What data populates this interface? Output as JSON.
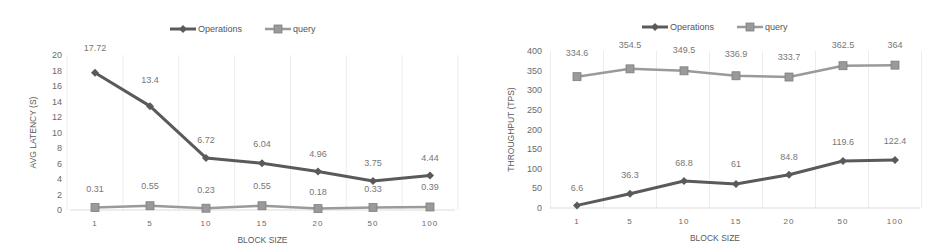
{
  "chart_data": [
    {
      "type": "line",
      "title": "",
      "xlabel": "BLOCK SIZE",
      "ylabel": "AVG LATENCY (S)",
      "categories": [
        "1",
        "5",
        "10",
        "15",
        "20",
        "50",
        "100"
      ],
      "ylim": [
        0,
        20
      ],
      "yticks": [
        0,
        2,
        4,
        6,
        8,
        10,
        12,
        14,
        16,
        18,
        20
      ],
      "grid": "vertical",
      "legend_position": "top",
      "series": [
        {
          "name": "Operations",
          "marker": "diamond",
          "color": "#5a5a5a",
          "values": [
            17.72,
            13.4,
            6.72,
            6.04,
            4.96,
            3.75,
            4.44
          ]
        },
        {
          "name": "query",
          "marker": "square",
          "color": "#9a9a9a",
          "values": [
            0.31,
            0.55,
            0.23,
            0.55,
            0.18,
            0.33,
            0.39
          ]
        }
      ]
    },
    {
      "type": "line",
      "title": "",
      "xlabel": "BLOCK SIZE",
      "ylabel": "THROUGHPUT (TPS)",
      "categories": [
        "1",
        "5",
        "10",
        "15",
        "20",
        "50",
        "100"
      ],
      "ylim": [
        0,
        400
      ],
      "yticks": [
        0,
        50,
        100,
        150,
        200,
        250,
        300,
        350,
        400
      ],
      "grid": "vertical",
      "legend_position": "top",
      "series": [
        {
          "name": "Operations",
          "marker": "diamond",
          "color": "#5a5a5a",
          "values": [
            6.6,
            36.3,
            68.8,
            61,
            84.8,
            119.6,
            122.4
          ]
        },
        {
          "name": "query",
          "marker": "square",
          "color": "#9a9a9a",
          "values": [
            334.6,
            354.5,
            349.5,
            336.9,
            333.7,
            362.5,
            364
          ]
        }
      ]
    }
  ]
}
